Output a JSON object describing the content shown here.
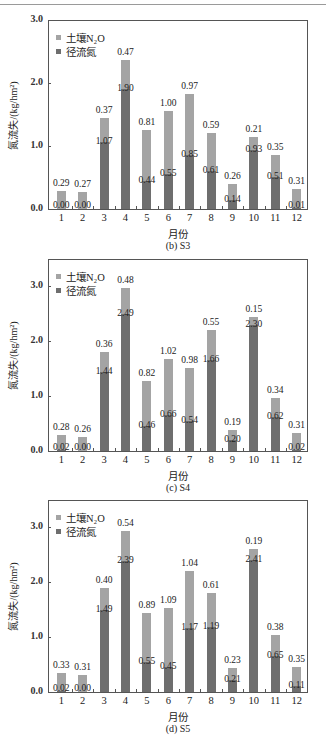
{
  "chart_data": [
    {
      "type": "bar",
      "stacked": true,
      "caption": "(b)  S3",
      "xlabel": "月份",
      "ylabel": "氮流失/(kg/hm²)",
      "ylim": [
        0,
        3.0
      ],
      "yticks": [
        "0.0",
        "1.0",
        "2.0",
        "3.0"
      ],
      "categories": [
        "1",
        "2",
        "3",
        "4",
        "5",
        "6",
        "7",
        "8",
        "9",
        "10",
        "11",
        "12"
      ],
      "legend": [
        "土壤N₂O",
        "径流氮"
      ],
      "series": [
        {
          "name": "径流氮",
          "values": [
            0.0,
            0.0,
            1.07,
            1.9,
            0.44,
            0.55,
            0.85,
            0.61,
            0.14,
            0.93,
            0.51,
            0.01
          ]
        },
        {
          "name": "土壤N₂O",
          "values": [
            0.29,
            0.27,
            0.37,
            0.47,
            0.81,
            1.0,
            0.97,
            0.59,
            0.26,
            0.21,
            0.35,
            0.31
          ]
        }
      ],
      "labels_runoff": [
        "0.00",
        "0.00",
        "1.07",
        "1.90",
        "0.44",
        "0.55",
        "0.85",
        "0.61",
        "0.14",
        "0.93",
        "0.51",
        "0.01"
      ],
      "labels_n2o": [
        "0.29",
        "0.27",
        "0.37",
        "0.47",
        "0.81",
        "1.00",
        "0.97",
        "0.59",
        "0.26",
        "0.21",
        "0.35",
        "0.31"
      ]
    },
    {
      "type": "bar",
      "stacked": true,
      "caption": "(c)  S4",
      "xlabel": "月份",
      "ylabel": "氮流失/(kg/hm²)",
      "ylim": [
        0,
        3.5
      ],
      "yticks": [
        "0.0",
        "1.0",
        "2.0",
        "3.0"
      ],
      "categories": [
        "1",
        "2",
        "3",
        "4",
        "5",
        "6",
        "7",
        "8",
        "9",
        "10",
        "11",
        "12"
      ],
      "legend": [
        "土壤N₂O",
        "径流氮"
      ],
      "series": [
        {
          "name": "径流氮",
          "values": [
            0.02,
            0.0,
            1.44,
            2.49,
            0.46,
            0.66,
            0.54,
            1.66,
            0.2,
            2.3,
            0.62,
            0.02
          ]
        },
        {
          "name": "土壤N₂O",
          "values": [
            0.28,
            0.26,
            0.36,
            0.48,
            0.82,
            1.02,
            0.98,
            0.55,
            0.19,
            0.15,
            0.34,
            0.31
          ]
        }
      ],
      "labels_runoff": [
        "0.02",
        "0.00",
        "1.44",
        "2.49",
        "0.46",
        "0.66",
        "0.54",
        "1.66",
        "0.20",
        "2.30",
        "0.62",
        "0.02"
      ],
      "labels_n2o": [
        "0.28",
        "0.26",
        "0.36",
        "0.48",
        "0.82",
        "1.02",
        "0.98",
        "0.55",
        "0.19",
        "0.15",
        "0.34",
        "0.31"
      ]
    },
    {
      "type": "bar",
      "stacked": true,
      "caption": "(d)  S5",
      "xlabel": "月份",
      "ylabel": "氮流失/(kg/hm²)",
      "ylim": [
        0,
        3.5
      ],
      "yticks": [
        "0.0",
        "1.0",
        "2.0",
        "3.0"
      ],
      "categories": [
        "1",
        "2",
        "3",
        "4",
        "5",
        "6",
        "7",
        "8",
        "9",
        "10",
        "11",
        "12"
      ],
      "legend": [
        "土壤N₂O",
        "径流氮"
      ],
      "series": [
        {
          "name": "径流氮",
          "values": [
            0.02,
            0.0,
            1.49,
            2.39,
            0.55,
            0.45,
            1.17,
            1.19,
            0.21,
            2.41,
            0.65,
            0.11
          ]
        },
        {
          "name": "土壤N₂O",
          "values": [
            0.33,
            0.31,
            0.4,
            0.54,
            0.89,
            1.09,
            1.04,
            0.61,
            0.23,
            0.19,
            0.38,
            0.35
          ]
        }
      ],
      "labels_runoff": [
        "0.02",
        "0.00",
        "1.49",
        "2.39",
        "0.55",
        "0.45",
        "1.17",
        "1.19",
        "0.21",
        "2.41",
        "0.65",
        "0.11"
      ],
      "labels_n2o": [
        "0.33",
        "0.31",
        "0.40",
        "0.54",
        "0.89",
        "1.09",
        "1.04",
        "0.61",
        "0.23",
        "0.19",
        "0.38",
        "0.35"
      ]
    }
  ],
  "colors": {
    "n2o": "#a4a4a4",
    "runoff": "#6e6e6e",
    "axis": "#555555"
  }
}
